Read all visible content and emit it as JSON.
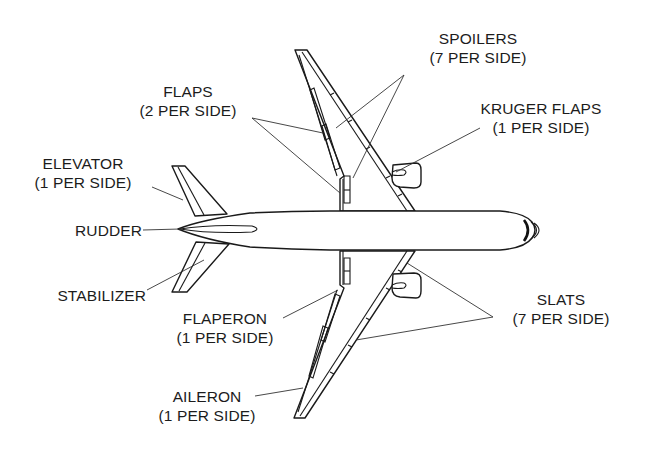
{
  "diagram": {
    "colors": {
      "line": "#1a1a1a",
      "text": "#1c1c1c",
      "background": "#ffffff"
    },
    "labels": {
      "spoilers": {
        "name": "SPOILERS",
        "count": "(7 PER SIDE)"
      },
      "flaps": {
        "name": "FLAPS",
        "count": "(2 PER SIDE)"
      },
      "kruger_flaps": {
        "name": "KRUGER FLAPS",
        "count": "(1 PER SIDE)"
      },
      "elevator": {
        "name": "ELEVATOR",
        "count": "(1 PER SIDE)"
      },
      "rudder": {
        "name": "RUDDER"
      },
      "stabilizer": {
        "name": "STABILIZER"
      },
      "flaperon": {
        "name": "FLAPERON",
        "count": "(1 PER SIDE)"
      },
      "slats": {
        "name": "SLATS",
        "count": "(7 PER SIDE)"
      },
      "aileron": {
        "name": "AILERON",
        "count": "(1 PER SIDE)"
      }
    }
  }
}
